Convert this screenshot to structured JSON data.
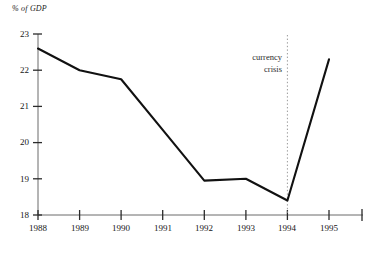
{
  "chart_data": {
    "type": "line",
    "title": "",
    "subtitle": "",
    "xlabel": "",
    "ylabel": "% of GDP",
    "ylim": [
      18,
      23
    ],
    "xlim": [
      1988,
      1995
    ],
    "grid": false,
    "legend": null,
    "x": [
      1988,
      1989,
      1990,
      1991,
      1992,
      1993,
      1994,
      1995
    ],
    "categories": [
      "1988",
      "1989",
      "1990",
      "1991",
      "1992",
      "1993",
      "1994",
      "1995"
    ],
    "values": [
      22.6,
      22.0,
      21.75,
      20.35,
      18.95,
      19.0,
      18.4,
      22.3
    ],
    "series": [
      {
        "name": "% of GDP",
        "values": [
          22.6,
          22.0,
          21.75,
          20.35,
          18.95,
          19.0,
          18.4,
          22.3
        ],
        "color": "#111111"
      }
    ],
    "y_ticks": [
      18,
      19,
      20,
      21,
      22,
      23
    ],
    "y_tick_labels": [
      "18",
      "19",
      "20",
      "21",
      "22",
      "23"
    ],
    "x_ticks": [
      1988,
      1989,
      1990,
      1991,
      1992,
      1993,
      1994,
      1995
    ],
    "x_tick_labels": [
      "1988",
      "1989",
      "1990",
      "1991",
      "1992",
      "1993",
      "1994",
      "1995"
    ],
    "annotations": [
      {
        "text_lines": [
          "currency",
          "crisis"
        ],
        "at_x": 1994,
        "type": "vertical-dotted-marker",
        "line_color": "#999999"
      }
    ],
    "axis_color": "#555555",
    "line_color": "#111111"
  },
  "axis": {
    "y_title": "% of GDP"
  },
  "annotation": {
    "line1": "currency",
    "line2": "crisis"
  },
  "y_labels": {
    "t0": "18",
    "t1": "19",
    "t2": "20",
    "t3": "21",
    "t4": "22",
    "t5": "23"
  },
  "x_labels": {
    "t0": "1988",
    "t1": "1989",
    "t2": "1990",
    "t3": "1991",
    "t4": "1992",
    "t5": "1993",
    "t6": "1994",
    "t7": "1995"
  }
}
